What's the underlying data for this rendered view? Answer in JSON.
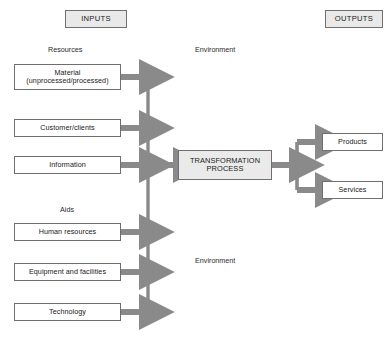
{
  "diagram": {
    "headers": {
      "inputs": "INPUTS",
      "outputs": "OUTPUTS"
    },
    "group_labels": {
      "resources": "Resources",
      "aids": "Aids"
    },
    "environment_labels": {
      "top": "Environment",
      "bottom": "Environment"
    },
    "inputs": {
      "resources": [
        {
          "line1": "Material",
          "line2": "(unprocessed/processed)"
        },
        {
          "line1": "Customer/clients",
          "line2": ""
        },
        {
          "line1": "Information",
          "line2": ""
        }
      ],
      "aids": [
        {
          "line1": "Human resources",
          "line2": ""
        },
        {
          "line1": "Equipment and facilities",
          "line2": ""
        },
        {
          "line1": "Technology",
          "line2": ""
        }
      ]
    },
    "process": {
      "line1": "TRANSFORMATION",
      "line2": "PROCESS"
    },
    "outputs": [
      {
        "label": "Products"
      },
      {
        "label": "Services"
      }
    ],
    "colors": {
      "arrow": "#8a8a8a",
      "box_border": "#6f6f6f",
      "header_fill": "#e9e9e9",
      "process_fill": "#eaeaea",
      "text": "#1a1a1a",
      "background": "#ffffff"
    }
  }
}
